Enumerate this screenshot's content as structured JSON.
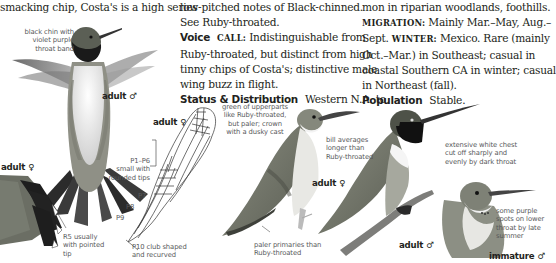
{
  "text_columns": {
    "col1": {
      "lines": [
        "smacking chip, Costa's is a high series"
      ]
    },
    "col2": {
      "lines": [
        "low-pitched notes of Black-chinned.",
        "See Ruby-throated."
      ],
      "voice_heading": "Voice",
      "voice_call_label": "CALL:",
      "voice_line1_rest": "Indistinguishable from",
      "voice_lines": [
        "Ruby-throated, but distinct from high",
        "tinny chips of Costa's; distinctive male",
        "wing buzz in flight."
      ],
      "status_heading": "Status & Distribution",
      "status_first": "Western N.A. to"
    },
    "col3": {
      "line1": "mon in riparian woodlands, foothills.",
      "migration_label": "MIGRATION:",
      "migration_text": "Mainly Mar.–May, Aug.–",
      "line3_a": "Sept.",
      "winter_label": "WINTER:",
      "line3_b": "Mexico. Rare (mainly",
      "lines": [
        "Oct.–Mar.) in Southeast; casual in",
        "coastal Southern CA in winter; casual",
        "in Northeast (fall)."
      ],
      "population_heading": "Population",
      "population_text": "Stable."
    }
  },
  "figure_labels": {
    "adult_male_flying": "adult ♂",
    "adult_female_wing": "adult ♀",
    "adult_female_tail": "adult ♀",
    "adult_female_perched": "adult ♀",
    "adult_male_perched": "adult ♂",
    "immature_male": "immature ♂"
  },
  "captions": {
    "black_chin": [
      "black chin with",
      "violet purple",
      "throat band"
    ],
    "p1_p6": [
      "P1–P6",
      "small with",
      "rounded tips"
    ],
    "p7": "P7",
    "p8": "P8",
    "p9": "P9",
    "p10": [
      "P10 club shaped",
      "and recurved"
    ],
    "r5": [
      "R5 usually",
      "with pointed",
      "tip"
    ],
    "green_upperparts": [
      "green of upperparts",
      "like Ruby-throated,",
      "but paler; crown",
      "with a dusky cast"
    ],
    "bill_averages": [
      "bill averages",
      "longer than",
      "Ruby-throated"
    ],
    "paler_primaries": [
      "paler primaries than",
      "Ruby-throated"
    ],
    "extensive_white": [
      "extensive white chest",
      "cut off sharply and",
      "evenly by dark throat"
    ],
    "purple_spots": [
      "some purple",
      "spots on lower",
      "throat by late",
      "summer"
    ]
  }
}
